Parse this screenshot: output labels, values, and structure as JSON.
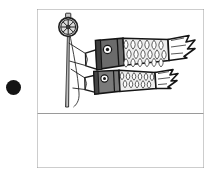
{
  "document": {
    "title": "Koinobori illustration panel",
    "background_color": "#ffffff"
  },
  "bullet": {
    "name": "list-bullet",
    "color": "#141414",
    "shape": "filled-circle"
  },
  "frame": {
    "border_color": "#9a9a9a",
    "fill_color": "#ffffff",
    "divider_color": "#9a9a9a",
    "divider_label": "caption-divider"
  },
  "illustration": {
    "subject": "koinobori-carp-streamers",
    "line_color": "#1a1a1a",
    "finial": {
      "name": "yaguruma-wheel-finial",
      "spoke_count": 8,
      "fill_color": "#d9d9d9",
      "knob_color": "#c9c9c9"
    },
    "pole": {
      "name": "flag-pole",
      "fill_color": "#c2c2c2",
      "rope_color": "#3a3a3a"
    },
    "carp": [
      {
        "name": "upper-carp-streamer",
        "position": "upper",
        "head_color": "#6b6b6b",
        "scale_color": "#e8e8e8",
        "mouth_color": "#ffffff",
        "eye_color": "#222222",
        "size": "large"
      },
      {
        "name": "lower-carp-streamer",
        "position": "lower",
        "head_color": "#7a7a7a",
        "scale_color": "#e8e8e8",
        "mouth_color": "#ffffff",
        "eye_color": "#222222",
        "size": "medium"
      }
    ]
  }
}
